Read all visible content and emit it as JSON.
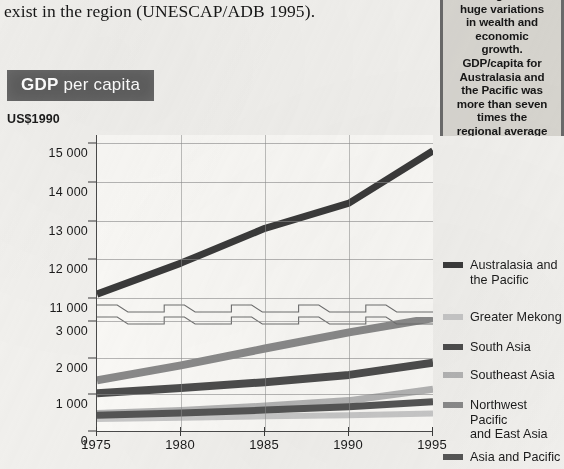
{
  "body_text": "exist in the region (UNESCAP/ADB 1995).",
  "title": {
    "strong": "GDP",
    "rest": " per capita"
  },
  "sidebar": {
    "text": "The region has\nhuge variations\nin wealth and\neconomic\ngrowth.\nGDP/capita for\nAustralasia and\nthe Pacific was\nmore than seven\ntimes the\nregional average\nin 1995"
  },
  "colors": {
    "banner_bg": "#5e5e5e",
    "banner_text": "#ffffff",
    "sidebar_bg": "#d8d6d0",
    "plot_bg": "#fbfaf7",
    "grid": "#8d8d8d",
    "axis": "#4a4a4a"
  },
  "chart_data": {
    "type": "line",
    "title": "GDP per capita",
    "ylabel": "US$1990",
    "xlabel": "",
    "grid": true,
    "legend_position": "right",
    "axis_break": {
      "present": true,
      "between": [
        3000,
        11000
      ]
    },
    "x": [
      1975,
      1980,
      1985,
      1990,
      1995
    ],
    "xtick_labels": [
      "1975",
      "1980",
      "1985",
      "1990",
      "1995"
    ],
    "ytick_labels": [
      "15 000",
      "14 000",
      "13 000",
      "12 000",
      "11 000",
      "3 000",
      "2 000",
      "1 000",
      "0"
    ],
    "ytick_values": [
      15000,
      14000,
      13000,
      12000,
      11000,
      3000,
      2000,
      1000,
      0
    ],
    "upper_range": [
      11000,
      15000
    ],
    "lower_range": [
      0,
      3000
    ],
    "series": [
      {
        "name": "Australasia and\nthe Pacific",
        "legend_label": "Australasia and\nthe Pacific",
        "color": "#3b3b3b",
        "width": 7,
        "values": [
          11100,
          11900,
          12800,
          13450,
          14800
        ]
      },
      {
        "name": "Greater Mekong",
        "legend_label": "Greater Mekong",
        "color": "#c8c8c8",
        "width": 6,
        "values": [
          330,
          360,
          400,
          430,
          480
        ]
      },
      {
        "name": "South Asia",
        "legend_label": "South Asia",
        "color": "#4d4d4d",
        "width": 8,
        "values": [
          1030,
          1170,
          1330,
          1530,
          1860
        ]
      },
      {
        "name": "Southeast Asia",
        "legend_label": "Southeast Asia",
        "color": "#b4b4b4",
        "width": 7,
        "values": [
          480,
          560,
          680,
          830,
          1140
        ]
      },
      {
        "name": "Northwest Pacific\nand East Asia",
        "legend_label": "Northwest Pacific\nand East Asia",
        "color": "#8a8a8a",
        "width": 8,
        "values": [
          1380,
          1790,
          2250,
          2690,
          3080
        ]
      },
      {
        "name": "Asia and Pacific",
        "legend_label": "Asia and Pacific",
        "color": "#555555",
        "width": 7,
        "values": [
          430,
          490,
          570,
          660,
          800
        ]
      }
    ]
  }
}
